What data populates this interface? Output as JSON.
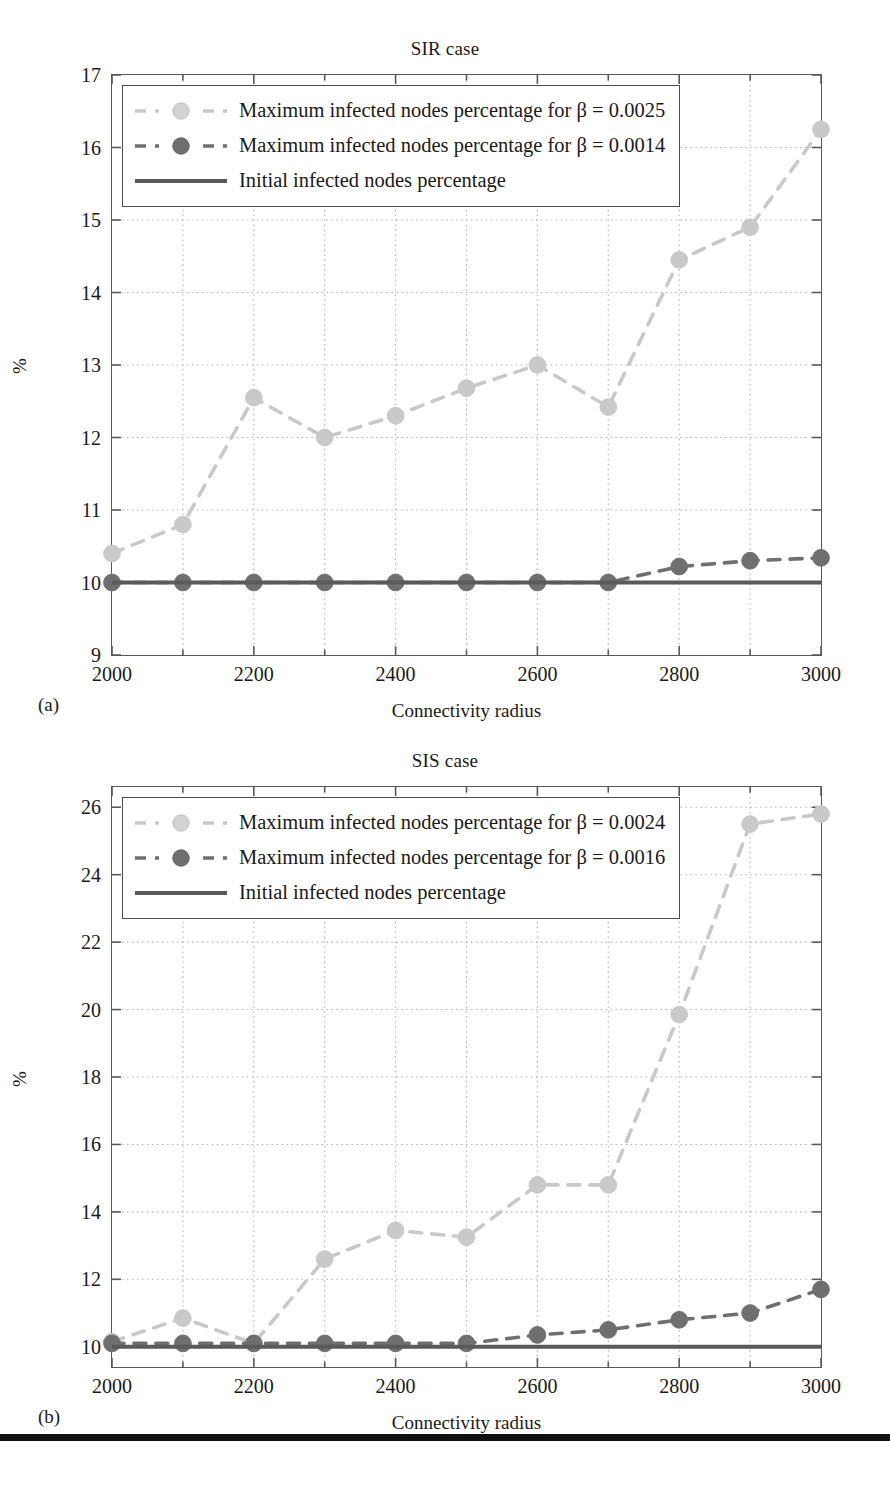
{
  "figure": {
    "panels": [
      {
        "id": "a",
        "subfig_label": "(a)",
        "title": "SIR case",
        "xlabel": "Connectivity radius",
        "ylabel": "%",
        "legend": [
          {
            "key": "light-dashed-circle",
            "label": "Maximum infected nodes percentage for β = 0.0025"
          },
          {
            "key": "dark-dashed-circle",
            "label": "Maximum infected nodes percentage for β = 0.0014"
          },
          {
            "key": "dark-solid-line",
            "label": "Initial infected nodes percentage"
          }
        ]
      },
      {
        "id": "b",
        "subfig_label": "(b)",
        "title": "SIS case",
        "xlabel": "Connectivity radius",
        "ylabel": "%",
        "legend": [
          {
            "key": "light-dashed-circle",
            "label": "Maximum infected nodes percentage for β = 0.0024"
          },
          {
            "key": "dark-dashed-circle",
            "label": "Maximum infected nodes percentage for β = 0.0016"
          },
          {
            "key": "dark-solid-line",
            "label": "Initial infected nodes percentage"
          }
        ]
      }
    ]
  },
  "colors": {
    "light_series": "#c9c9c9",
    "dark_series": "#6f6f6f",
    "baseline": "#5a5a5a",
    "axis": "#595959",
    "grid": "#b5b5b5",
    "text": "#1a1a1a",
    "rule": "#111111"
  },
  "chart_data": [
    {
      "type": "line",
      "panel": "a",
      "title": "SIR case",
      "xlabel": "Connectivity radius",
      "ylabel": "%",
      "x": [
        2000,
        2100,
        2200,
        2300,
        2400,
        2500,
        2600,
        2700,
        2800,
        2900,
        3000
      ],
      "xlim": [
        2000,
        3000
      ],
      "ylim": [
        9,
        17
      ],
      "xticks": [
        2000,
        2200,
        2400,
        2600,
        2800,
        3000
      ],
      "xticklabels": [
        "2000",
        "2200",
        "2400",
        "2600",
        "2800",
        "3000"
      ],
      "xminorticks": [
        2100,
        2300,
        2500,
        2700,
        2900
      ],
      "yticks": [
        9,
        10,
        11,
        12,
        13,
        14,
        15,
        16,
        17
      ],
      "yticklabels": [
        "9",
        "10",
        "11",
        "12",
        "13",
        "14",
        "15",
        "16",
        "17"
      ],
      "grid": true,
      "legend_position": "upper-left",
      "series": [
        {
          "name": "Maximum infected nodes percentage for β = 0.0025",
          "style": "dashed",
          "marker": "circle",
          "color": "#c9c9c9",
          "values": [
            10.4,
            10.8,
            12.55,
            12.0,
            12.3,
            12.68,
            13.0,
            12.42,
            14.45,
            14.9,
            16.25
          ]
        },
        {
          "name": "Maximum infected nodes percentage for β = 0.0014",
          "style": "dashed",
          "marker": "circle",
          "color": "#6f6f6f",
          "values": [
            10.0,
            10.0,
            10.0,
            10.0,
            10.0,
            10.0,
            10.0,
            10.0,
            10.22,
            10.3,
            10.34
          ]
        },
        {
          "name": "Initial infected nodes percentage",
          "style": "solid",
          "marker": "none",
          "color": "#5a5a5a",
          "values": [
            10.0,
            10.0,
            10.0,
            10.0,
            10.0,
            10.0,
            10.0,
            10.0,
            10.0,
            10.0,
            10.0
          ]
        }
      ]
    },
    {
      "type": "line",
      "panel": "b",
      "title": "SIS case",
      "xlabel": "Connectivity radius",
      "ylabel": "%",
      "x": [
        2000,
        2100,
        2200,
        2300,
        2400,
        2500,
        2600,
        2700,
        2800,
        2900,
        3000
      ],
      "xlim": [
        2000,
        3000
      ],
      "ylim": [
        9.4,
        26.6
      ],
      "xticks": [
        2000,
        2200,
        2400,
        2600,
        2800,
        3000
      ],
      "xticklabels": [
        "2000",
        "2200",
        "2400",
        "2600",
        "2800",
        "3000"
      ],
      "xminorticks": [
        2100,
        2300,
        2500,
        2700,
        2900
      ],
      "yticks": [
        10,
        12,
        14,
        16,
        18,
        20,
        22,
        24,
        26
      ],
      "yticklabels": [
        "10",
        "12",
        "14",
        "16",
        "18",
        "20",
        "22",
        "24",
        "26"
      ],
      "grid": true,
      "legend_position": "upper-left",
      "series": [
        {
          "name": "Maximum infected nodes percentage for β = 0.0024",
          "style": "dashed",
          "marker": "circle",
          "color": "#c9c9c9",
          "values": [
            10.15,
            10.85,
            10.1,
            12.6,
            13.45,
            13.25,
            14.8,
            14.8,
            19.85,
            25.5,
            25.8
          ]
        },
        {
          "name": "Maximum infected nodes percentage for β = 0.0016",
          "style": "dashed",
          "marker": "circle",
          "color": "#6f6f6f",
          "values": [
            10.1,
            10.1,
            10.1,
            10.1,
            10.1,
            10.1,
            10.35,
            10.5,
            10.8,
            11.0,
            11.7
          ]
        },
        {
          "name": "Initial infected nodes percentage",
          "style": "solid",
          "marker": "none",
          "color": "#5a5a5a",
          "values": [
            10.0,
            10.0,
            10.0,
            10.0,
            10.0,
            10.0,
            10.0,
            10.0,
            10.0,
            10.0,
            10.0
          ]
        }
      ]
    }
  ]
}
